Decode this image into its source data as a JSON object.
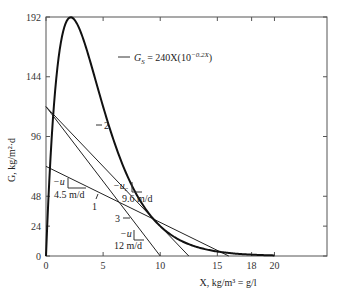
{
  "chart_data": {
    "type": "line",
    "title": "",
    "xlabel": "X, kg/m³ = g/l",
    "ylabel": "G, kg/m²·d",
    "xlim": [
      0,
      24.6
    ],
    "ylim": [
      0,
      192
    ],
    "x_ticks": [
      0,
      5,
      10,
      15,
      18,
      20
    ],
    "y_ticks": [
      0,
      24,
      48,
      96,
      144,
      192
    ],
    "grid": false,
    "curve": {
      "name": "solids flux",
      "label_main": "G",
      "label_sub": "S",
      "label_rest": " = 240X(10",
      "label_exp": "−0.2X",
      "label_close": ")",
      "formula": "G_S = 240X(10^(-0.2X))",
      "x_range": [
        0,
        20
      ]
    },
    "lines": [
      {
        "name": "1",
        "intercept": 72,
        "x_zero": 16,
        "slope_label": "4.5 m/d",
        "u_label": "−u"
      },
      {
        "name": "2",
        "intercept": 120,
        "x_zero": 12.5,
        "slope_label": "9.6 m/d",
        "u_label": "−u",
        "u_sub": "c"
      },
      {
        "name": "3",
        "intercept": 120,
        "x_zero": 10,
        "slope_label": "12 m/d",
        "u_label": "−u"
      }
    ]
  }
}
